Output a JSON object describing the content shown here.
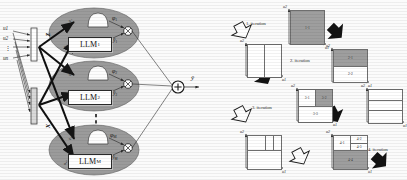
{
  "figure": {
    "panels": [
      "network-architecture",
      "iterative-partitioning"
    ]
  },
  "left_panel": {
    "title_hidden": "",
    "inputs": {
      "labels": [
        "u1",
        "u2",
        "u3",
        "un"
      ],
      "vdots": "⋮"
    },
    "input_vectors": [
      {
        "name": "z-vector",
        "label": "z"
      },
      {
        "name": "x-vector",
        "label": "x"
      }
    ],
    "branches": [
      {
        "id": "branch-1",
        "llm_label": "LLM",
        "llm_sub": "1",
        "membership_label": "φ",
        "membership_sub": "1",
        "output_label": "ŷ",
        "output_sub": "1",
        "in_z": "z",
        "in_x": "x",
        "in_z_sub": "1",
        "in_x_sub": "1",
        "product_glyph": "⊗"
      },
      {
        "id": "branch-2",
        "llm_label": "LLM",
        "llm_sub": "2",
        "membership_label": "φ",
        "membership_sub": "2",
        "output_label": "ŷ",
        "output_sub": "2",
        "in_z": "z",
        "in_x": "x",
        "in_z_sub": "2",
        "in_x_sub": "2",
        "product_glyph": "⊗"
      },
      {
        "id": "branch-m",
        "llm_label": "LLM",
        "llm_sub": "M",
        "membership_label": "φ",
        "membership_sub": "M",
        "output_label": "ŷ",
        "output_sub": "M",
        "in_z": "z",
        "in_x": "x",
        "in_z_sub": "M",
        "in_x_sub": "M",
        "product_glyph": "⊗"
      }
    ],
    "branch_ellipsis": "⋮",
    "sum_node": {
      "glyph": "+",
      "name": "summation-node"
    },
    "final_output": {
      "label": "ŷ"
    }
  },
  "right_panel": {
    "iterations": [
      {
        "id": "iteration-1",
        "label": "1. iteration",
        "cells": [
          {
            "label": "1-1",
            "shade": "gray",
            "x": 0,
            "y": 0,
            "w": 100,
            "h": 100
          }
        ],
        "axis_x": "u1",
        "axis_y": "u2"
      },
      {
        "id": "iteration-2",
        "label": "2. iteration",
        "cells": [
          {
            "label": "2-1",
            "shade": "gray",
            "x": 0,
            "y": 0,
            "w": 100,
            "h": 52
          },
          {
            "label": "2-2",
            "shade": "white",
            "x": 0,
            "y": 52,
            "w": 100,
            "h": 48
          }
        ],
        "axis_x": "u1",
        "axis_y": "u2"
      },
      {
        "id": "iteration-3",
        "label": "3. iteration",
        "cells": [
          {
            "label": "3-1",
            "shade": "white",
            "x": 0,
            "y": 0,
            "w": 52,
            "h": 52
          },
          {
            "label": "3-2",
            "shade": "gray",
            "x": 52,
            "y": 0,
            "w": 48,
            "h": 52
          },
          {
            "label": "3-3",
            "shade": "white",
            "x": 0,
            "y": 52,
            "w": 100,
            "h": 48
          }
        ],
        "axis_x": "u1",
        "axis_y": "u2"
      },
      {
        "id": "iteration-4",
        "label": "4. iteration",
        "cells": [
          {
            "label": "4-1",
            "shade": "white",
            "x": 0,
            "y": 0,
            "w": 52,
            "h": 46
          },
          {
            "label": "4-2",
            "shade": "white",
            "x": 52,
            "y": 0,
            "w": 48,
            "h": 24
          },
          {
            "label": "4-3",
            "shade": "white",
            "x": 52,
            "y": 24,
            "w": 48,
            "h": 22
          },
          {
            "label": "4-4",
            "shade": "gray",
            "x": 0,
            "y": 46,
            "w": 100,
            "h": 54
          }
        ],
        "axis_x": "u1",
        "axis_y": "u2"
      }
    ],
    "structure_boxes": [
      {
        "id": "structure-box-1",
        "axis_x": "u1",
        "axis_y": "u2",
        "cells": [
          {
            "x": 0,
            "y": 0,
            "w": 50,
            "h": 100
          },
          {
            "x": 50,
            "y": 0,
            "w": 50,
            "h": 100
          }
        ]
      },
      {
        "id": "structure-box-2",
        "axis_x": "u1",
        "axis_y": "u2",
        "cells": [
          {
            "x": 0,
            "y": 0,
            "w": 100,
            "h": 33
          },
          {
            "x": 0,
            "y": 33,
            "w": 100,
            "h": 30
          },
          {
            "x": 0,
            "y": 63,
            "w": 100,
            "h": 37
          }
        ]
      },
      {
        "id": "structure-box-3",
        "axis_x": "u1",
        "axis_y": "u2",
        "cells": [
          {
            "x": 0,
            "y": 0,
            "w": 55,
            "h": 46
          },
          {
            "x": 55,
            "y": 0,
            "w": 23,
            "h": 46
          },
          {
            "x": 78,
            "y": 0,
            "w": 22,
            "h": 46
          },
          {
            "x": 0,
            "y": 46,
            "w": 100,
            "h": 54
          }
        ]
      }
    ],
    "arrows": {
      "filled": "black-arrow",
      "hollow": "white-arrow"
    }
  },
  "colors": {
    "gray_fill": "#9e9e9e",
    "ellipse_fill": "#9b9b9b",
    "line": "#1a1a1a",
    "box_border": "#6e6e6e",
    "background": "#fbfbfb"
  }
}
